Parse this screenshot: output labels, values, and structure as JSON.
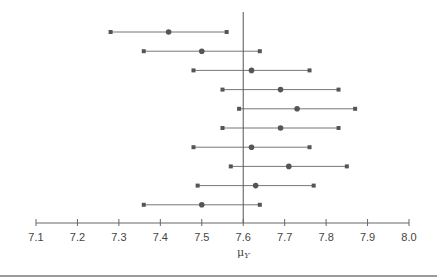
{
  "chart_data": {
    "type": "interval",
    "title": "",
    "xlabel": "μ_Y",
    "xlabel_main": "μ",
    "xlabel_sub": "Y",
    "ylabel": "",
    "xlim": [
      7.1,
      8.0
    ],
    "reference_line": 7.6,
    "ticks": [
      "7.1",
      "7.2",
      "7.3",
      "7.4",
      "7.5",
      "7.6",
      "7.7",
      "7.8",
      "7.9",
      "8.0"
    ],
    "grid": false,
    "series": [
      {
        "name": "interval 1",
        "lower": 7.28,
        "estimate": 7.42,
        "upper": 7.56
      },
      {
        "name": "interval 2",
        "lower": 7.36,
        "estimate": 7.5,
        "upper": 7.64
      },
      {
        "name": "interval 3",
        "lower": 7.48,
        "estimate": 7.62,
        "upper": 7.76
      },
      {
        "name": "interval 4",
        "lower": 7.55,
        "estimate": 7.69,
        "upper": 7.83
      },
      {
        "name": "interval 5",
        "lower": 7.59,
        "estimate": 7.73,
        "upper": 7.87
      },
      {
        "name": "interval 6",
        "lower": 7.55,
        "estimate": 7.69,
        "upper": 7.83
      },
      {
        "name": "interval 7",
        "lower": 7.48,
        "estimate": 7.62,
        "upper": 7.76
      },
      {
        "name": "interval 8",
        "lower": 7.57,
        "estimate": 7.71,
        "upper": 7.85
      },
      {
        "name": "interval 9",
        "lower": 7.49,
        "estimate": 7.63,
        "upper": 7.77
      },
      {
        "name": "interval 10",
        "lower": 7.36,
        "estimate": 7.5,
        "upper": 7.64
      }
    ]
  },
  "style": {
    "line_color": "#777777",
    "marker_color": "#555555",
    "axis_color": "#666666",
    "ref_line_color": "#555555"
  }
}
